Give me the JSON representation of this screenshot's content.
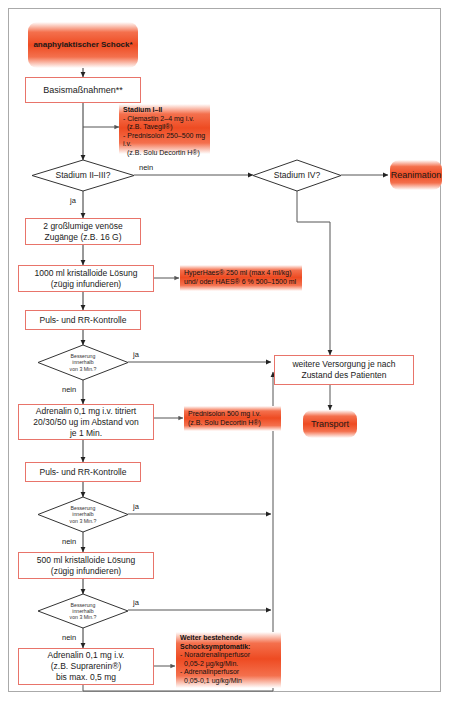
{
  "diagram": {
    "colors": {
      "accent_orange": "#ee4b22",
      "box_border": "#e8746a",
      "edge": "#333333"
    },
    "nodes": {
      "start": {
        "label": "anaphylaktischer Schock*"
      },
      "basis": {
        "label": "Basismaßnahmen**"
      },
      "ann_stadium_i_ii": {
        "heading": "Stadium I–II",
        "lines": [
          "- Clemastin 2–4 mg i.v.",
          "(z.B. Tavegil®)",
          "- Prednisolon 250–500 mg i.v.",
          "(z.B. Solu Decortin H®)"
        ]
      },
      "d_stadium_ii_iii": {
        "label": "Stadium II–III?"
      },
      "d_stadium_iv": {
        "label": "Stadium IV?"
      },
      "reanimation": {
        "label": "Reanimation"
      },
      "zugaenge": {
        "line1": "2 großlumige venöse",
        "line2": "Zugänge (z.B. 16 G)"
      },
      "kristalloid_1000": {
        "line1": "1000 ml kristalloide Lösung",
        "line2": "(zügig infundieren)"
      },
      "ann_hyperhaes": {
        "lines": [
          "HyperHaes® 250 ml (max 4 ml/kg)",
          "und/ oder HAES® 6 % 500–1500 ml"
        ]
      },
      "puls_rr_1": {
        "label": "Puls- und RR-Kontrolle"
      },
      "d_besserung_1": {
        "line1": "Besserung",
        "line2": "innerhalb",
        "line3": "von 3 Min.?"
      },
      "adrenalin_titriert": {
        "line1": "Adrenalin 0,1 mg i.v. titriert",
        "line2": "20/30/50 ug im Abstand von",
        "line3": "je 1 Min."
      },
      "ann_prednisolon": {
        "lines": [
          "Prednisolon 500 mg i.v.",
          "(z.B. Solu Decortin H®)"
        ]
      },
      "puls_rr_2": {
        "label": "Puls- und RR-Kontrolle"
      },
      "d_besserung_2": {
        "line1": "Besserung",
        "line2": "innerhalb",
        "line3": "von 3 Min.?"
      },
      "kristalloid_500": {
        "line1": "500 ml kristalloide Lösung",
        "line2": "(zügig infundieren)"
      },
      "d_besserung_3": {
        "line1": "Besserung",
        "line2": "innerhalb",
        "line3": "von 3 Min.?"
      },
      "adrenalin_max": {
        "line1": "Adrenalin 0,1  mg i.v.",
        "line2": "(z.B. Suprarenin®)",
        "line3": "bis max. 0,5 mg"
      },
      "ann_schocksymptomatik": {
        "heading1": "Weiter bestehende",
        "heading2": "Schocksymptomatik:",
        "lines": [
          "- Noradrenalinperfusor",
          "0,05-2 µg/kg/Min.",
          "- Adrenalinperfusor",
          "0,05-0,1 ug/kg/Min"
        ]
      },
      "weitere_versorgung": {
        "line1": "weitere Versorgung je nach",
        "line2": "Zustand des Patienten"
      },
      "transport": {
        "label": "Transport"
      }
    },
    "edge_labels": {
      "nein_1": "nein",
      "ja_1": "ja",
      "ja_2": "ja",
      "nein_2": "nein",
      "ja_3": "ja",
      "nein_3": "nein",
      "ja_4": "ja",
      "nein_4": "nein"
    }
  }
}
